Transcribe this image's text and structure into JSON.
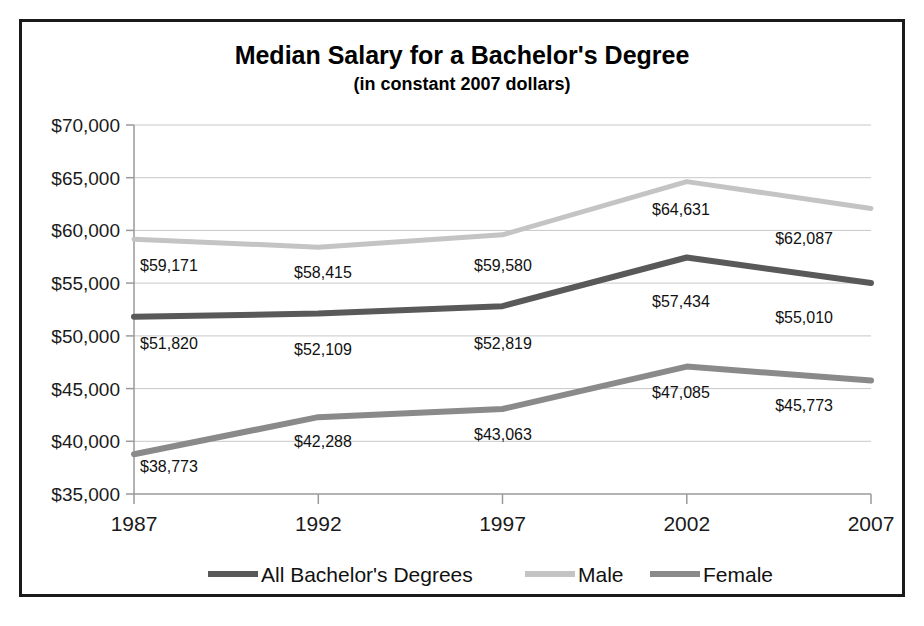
{
  "chart_data": {
    "type": "line",
    "title": "Median Salary for a Bachelor's Degree",
    "subtitle": "(in constant 2007 dollars)",
    "xlabel": "",
    "ylabel": "",
    "categories": [
      "1987",
      "1992",
      "1997",
      "2002",
      "2007"
    ],
    "x": [
      1987,
      1992,
      1997,
      2002,
      2007
    ],
    "ylim": [
      35000,
      70000
    ],
    "ytick_labels": [
      "$70,000",
      "$65,000",
      "$60,000",
      "$55,000",
      "$50,000",
      "$45,000",
      "$40,000",
      "$35,000"
    ],
    "ytick_values": [
      70000,
      65000,
      60000,
      55000,
      50000,
      45000,
      40000,
      35000
    ],
    "grid": true,
    "legend_position": "bottom",
    "series": [
      {
        "name": "All Bachelor's Degrees",
        "color": "#595959",
        "values": [
          51820,
          52109,
          52819,
          57434,
          55010
        ],
        "labels": [
          "$51,820",
          "$52,109",
          "$52,819",
          "$57,434",
          "$55,010"
        ]
      },
      {
        "name": "Male",
        "color": "#c4c4c4",
        "values": [
          59171,
          58415,
          59580,
          64631,
          62087
        ],
        "labels": [
          "$59,171",
          "$58,415",
          "$59,580",
          "$64,631",
          "$62,087"
        ]
      },
      {
        "name": "Female",
        "color": "#8a8a8a",
        "values": [
          38773,
          42288,
          43063,
          47085,
          45773
        ],
        "labels": [
          "$38,773",
          "$42,288",
          "$43,063",
          "$47,085",
          "$45,773"
        ]
      }
    ]
  },
  "legend": {
    "items": [
      {
        "label": "All Bachelor's Degrees",
        "color": "#595959"
      },
      {
        "label": "Male",
        "color": "#c4c4c4"
      },
      {
        "label": "Female",
        "color": "#8a8a8a"
      }
    ]
  },
  "ytick_labels": {
    "t0": "$70,000",
    "t1": "$65,000",
    "t2": "$60,000",
    "t3": "$55,000",
    "t4": "$50,000",
    "t5": "$45,000",
    "t6": "$40,000",
    "t7": "$35,000"
  },
  "xtick_labels": {
    "t0": "1987",
    "t1": "1992",
    "t2": "1997",
    "t3": "2002",
    "t4": "2007"
  },
  "point_labels": {
    "male": {
      "p0": "$59,171",
      "p1": "$58,415",
      "p2": "$59,580",
      "p3": "$64,631",
      "p4": "$62,087"
    },
    "all": {
      "p0": "$51,820",
      "p1": "$52,109",
      "p2": "$52,819",
      "p3": "$57,434",
      "p4": "$55,010"
    },
    "female": {
      "p0": "$38,773",
      "p1": "$42,288",
      "p2": "$43,063",
      "p3": "$47,085",
      "p4": "$45,773"
    }
  }
}
